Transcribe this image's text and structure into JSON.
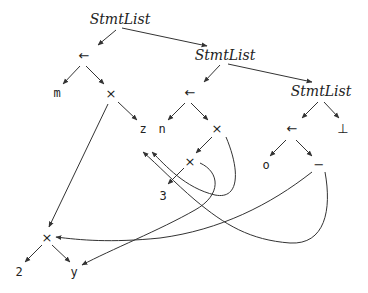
{
  "diagram": {
    "type": "directed acyclic graph (syntax tree with shared nodes)",
    "nodes": {
      "stmtlist1": "StmtList",
      "stmtlist2": "StmtList",
      "stmtlist3": "StmtList",
      "assign1": "←",
      "assign2": "←",
      "assign3": "←",
      "m": "m",
      "times1": "×",
      "z": "z",
      "n": "n",
      "times2": "×",
      "times3": "×",
      "three": "3",
      "o": "o",
      "minus": "−",
      "bottom": "⊥",
      "times4": "×",
      "two": "2",
      "y": "y"
    },
    "edges": [
      [
        "stmtlist1",
        "assign1"
      ],
      [
        "stmtlist1",
        "stmtlist2"
      ],
      [
        "assign1",
        "m"
      ],
      [
        "assign1",
        "times1"
      ],
      [
        "times1",
        "z"
      ],
      [
        "times1",
        "times4"
      ],
      [
        "stmtlist2",
        "assign2"
      ],
      [
        "stmtlist2",
        "stmtlist3"
      ],
      [
        "assign2",
        "n"
      ],
      [
        "assign2",
        "times2"
      ],
      [
        "times2",
        "times3"
      ],
      [
        "times2",
        "z"
      ],
      [
        "times3",
        "three"
      ],
      [
        "times3",
        "y"
      ],
      [
        "stmtlist3",
        "assign3"
      ],
      [
        "stmtlist3",
        "bottom"
      ],
      [
        "assign3",
        "o"
      ],
      [
        "assign3",
        "minus"
      ],
      [
        "minus",
        "times4"
      ],
      [
        "minus",
        "z"
      ],
      [
        "times4",
        "two"
      ],
      [
        "times4",
        "y"
      ]
    ]
  }
}
